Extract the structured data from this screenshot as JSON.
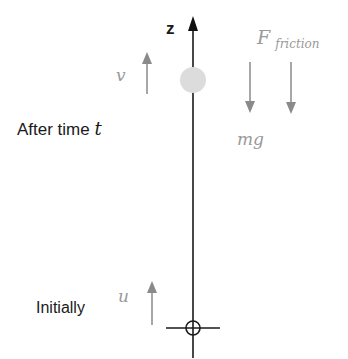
{
  "diagram": {
    "axis": {
      "label": "z",
      "color": "#111111"
    },
    "ball": {
      "color": "#dcdcdc"
    },
    "states": {
      "after": {
        "label": "After time ",
        "time_symbol": "t",
        "velocity_symbol": "v"
      },
      "initial": {
        "label": "Initially",
        "velocity_symbol": "u"
      }
    },
    "forces": {
      "weight": {
        "symbol": "mg"
      },
      "friction": {
        "symbol": "F",
        "subscript": "friction"
      }
    },
    "colors": {
      "arrow_gray": "#8a8a8a",
      "symbol_gray": "#9a9a9a",
      "text_dark": "#1a1a1a"
    }
  }
}
